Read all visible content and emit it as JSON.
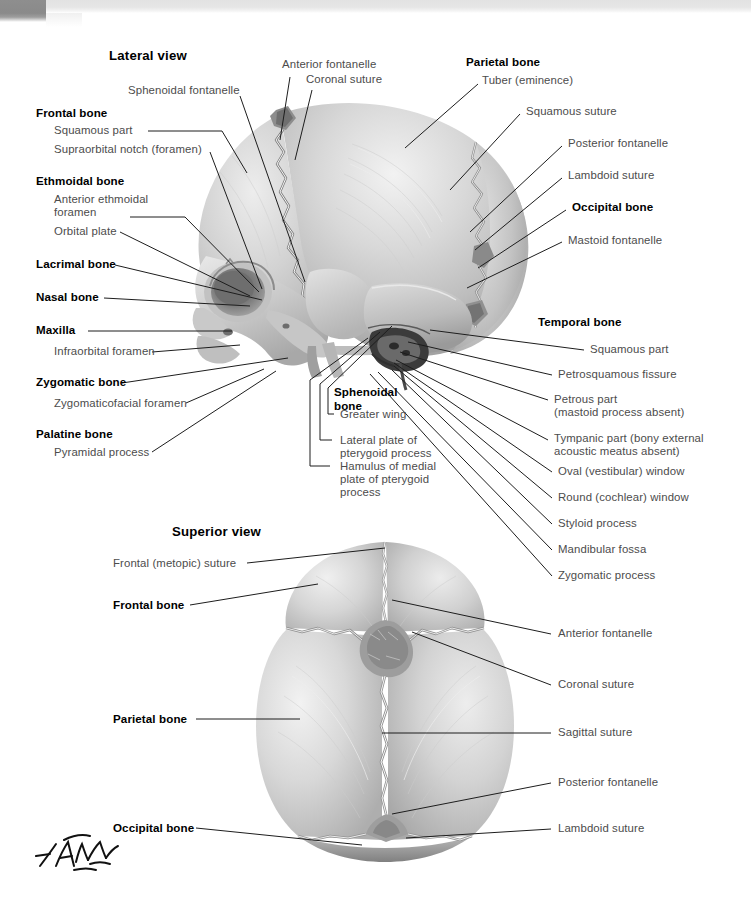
{
  "plate": {
    "artist_signature": "F. Netter",
    "background_color": "#ffffff",
    "label_color": "#4c4c4c",
    "bold_label_color": "#000000",
    "leader_color": "#1d1d1d"
  },
  "views": [
    {
      "id": "lateral",
      "title": "Lateral view"
    },
    {
      "id": "superior",
      "title": "Superior view"
    }
  ],
  "lateral_view": {
    "title": "Lateral view",
    "labels_left": [
      {
        "text": "Sphenoidal fontanelle",
        "bold": false
      },
      {
        "text": "Frontal bone",
        "bold": true
      },
      {
        "text": "Squamous part",
        "bold": false
      },
      {
        "text": "Supraorbital notch (foramen)",
        "bold": false
      },
      {
        "text": "Ethmoidal bone",
        "bold": true
      },
      {
        "text": "Anterior ethmoidal",
        "bold": false
      },
      {
        "text": "foramen",
        "bold": false
      },
      {
        "text": "Orbital plate",
        "bold": false
      },
      {
        "text": "Lacrimal bone",
        "bold": true
      },
      {
        "text": "Nasal bone",
        "bold": true
      },
      {
        "text": "Maxilla",
        "bold": true
      },
      {
        "text": "Infraorbital foramen",
        "bold": false
      },
      {
        "text": "Zygomatic bone",
        "bold": true
      },
      {
        "text": "Zygomaticofacial foramen",
        "bold": false
      },
      {
        "text": "Palatine bone",
        "bold": true
      },
      {
        "text": "Pyramidal process",
        "bold": false
      }
    ],
    "labels_top": [
      {
        "text": "Anterior fontanelle",
        "bold": false
      },
      {
        "text": "Coronal suture",
        "bold": false
      }
    ],
    "labels_center": [
      {
        "text": "Sphenoidal",
        "bold": true
      },
      {
        "text": "bone",
        "bold": true
      },
      {
        "text": "Greater wing",
        "bold": false
      },
      {
        "text": "Lateral plate of",
        "bold": false
      },
      {
        "text": "pterygoid process",
        "bold": false
      },
      {
        "text": "Hamulus of medial",
        "bold": false
      },
      {
        "text": "plate of pterygoid",
        "bold": false
      },
      {
        "text": "process",
        "bold": false
      }
    ],
    "labels_right": [
      {
        "text": "Parietal bone",
        "bold": true
      },
      {
        "text": "Tuber (eminence)",
        "bold": false
      },
      {
        "text": "Squamous suture",
        "bold": false
      },
      {
        "text": "Posterior fontanelle",
        "bold": false
      },
      {
        "text": "Lambdoid suture",
        "bold": false
      },
      {
        "text": "Occipital bone",
        "bold": true
      },
      {
        "text": "Mastoid fontanelle",
        "bold": false
      },
      {
        "text": "Temporal bone",
        "bold": true
      },
      {
        "text": "Squamous part",
        "bold": false
      },
      {
        "text": "Petrosquamous fissure",
        "bold": false
      },
      {
        "text": "Petrous part",
        "bold": false
      },
      {
        "text": "(mastoid process absent)",
        "bold": false
      },
      {
        "text": "Tympanic part (bony external",
        "bold": false
      },
      {
        "text": "acoustic meatus absent)",
        "bold": false
      },
      {
        "text": "Oval (vestibular) window",
        "bold": false
      },
      {
        "text": "Round (cochlear) window",
        "bold": false
      },
      {
        "text": "Styloid process",
        "bold": false
      },
      {
        "text": "Mandibular fossa",
        "bold": false
      },
      {
        "text": "Zygomatic process",
        "bold": false
      }
    ]
  },
  "superior_view": {
    "title": "Superior view",
    "labels_left": [
      {
        "text": "Frontal (metopic) suture",
        "bold": false
      },
      {
        "text": "Frontal bone",
        "bold": true
      },
      {
        "text": "Parietal bone",
        "bold": true
      },
      {
        "text": "Occipital bone",
        "bold": true
      }
    ],
    "labels_right": [
      {
        "text": "Anterior fontanelle",
        "bold": false
      },
      {
        "text": "Coronal suture",
        "bold": false
      },
      {
        "text": "Sagittal suture",
        "bold": false
      },
      {
        "text": "Posterior fontanelle",
        "bold": false
      },
      {
        "text": "Lambdoid suture",
        "bold": false
      }
    ]
  }
}
